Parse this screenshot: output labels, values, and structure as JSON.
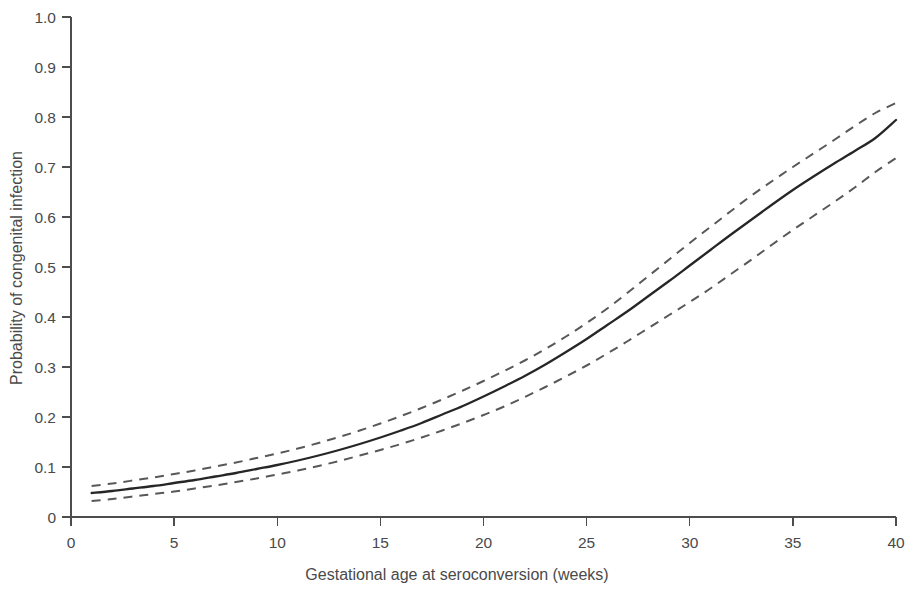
{
  "chart_data": {
    "type": "line",
    "title": "",
    "subtitle": "",
    "xlabel": "Gestational age at seroconversion (weeks)",
    "ylabel": "Probability of congenital infection",
    "xlim": [
      0,
      40
    ],
    "ylim": [
      0,
      1.0
    ],
    "grid": false,
    "legend": null,
    "legend_position": "none",
    "xticks": [
      0,
      5,
      10,
      15,
      20,
      25,
      30,
      35,
      40
    ],
    "xtick_labels": [
      "0",
      "5",
      "10",
      "15",
      "20",
      "25",
      "30",
      "35",
      "40"
    ],
    "yticks": [
      0,
      0.1,
      0.2,
      0.3,
      0.4,
      0.5,
      0.6,
      0.7,
      0.8,
      0.9,
      1.0
    ],
    "ytick_labels": [
      "0",
      "0.1",
      "0.2",
      "0.3",
      "0.4",
      "0.5",
      "0.6",
      "0.7",
      "0.8",
      "0.9",
      "1.0"
    ],
    "x": [
      1,
      2,
      3,
      4,
      5,
      6,
      7,
      8,
      9,
      10,
      11,
      12,
      13,
      14,
      15,
      16,
      17,
      18,
      19,
      20,
      21,
      22,
      23,
      24,
      25,
      26,
      27,
      28,
      29,
      30,
      31,
      32,
      33,
      34,
      35,
      36,
      37,
      38,
      39,
      40
    ],
    "series": [
      {
        "name": "Fitted probability of congenital infection",
        "style": "solid",
        "color": "#262626",
        "values": [
          0.048,
          0.052,
          0.057,
          0.062,
          0.068,
          0.074,
          0.081,
          0.088,
          0.096,
          0.104,
          0.113,
          0.123,
          0.134,
          0.146,
          0.159,
          0.173,
          0.188,
          0.205,
          0.222,
          0.241,
          0.261,
          0.282,
          0.305,
          0.33,
          0.356,
          0.384,
          0.412,
          0.442,
          0.472,
          0.503,
          0.534,
          0.565,
          0.595,
          0.625,
          0.654,
          0.681,
          0.707,
          0.732,
          0.758,
          0.794
        ]
      },
      {
        "name": "Upper 95% confidence limit",
        "style": "dashed",
        "color": "#585858",
        "values": [
          0.062,
          0.067,
          0.073,
          0.079,
          0.086,
          0.093,
          0.101,
          0.109,
          0.118,
          0.127,
          0.137,
          0.148,
          0.16,
          0.173,
          0.187,
          0.202,
          0.218,
          0.235,
          0.253,
          0.272,
          0.292,
          0.313,
          0.336,
          0.361,
          0.388,
          0.417,
          0.449,
          0.482,
          0.515,
          0.548,
          0.58,
          0.612,
          0.643,
          0.672,
          0.7,
          0.727,
          0.754,
          0.782,
          0.808,
          0.828
        ]
      },
      {
        "name": "Lower 95% confidence limit",
        "style": "dashed",
        "color": "#585858",
        "values": [
          0.032,
          0.036,
          0.041,
          0.046,
          0.051,
          0.057,
          0.063,
          0.07,
          0.077,
          0.085,
          0.093,
          0.102,
          0.112,
          0.123,
          0.134,
          0.146,
          0.159,
          0.173,
          0.188,
          0.204,
          0.221,
          0.24,
          0.26,
          0.281,
          0.303,
          0.327,
          0.352,
          0.378,
          0.404,
          0.43,
          0.457,
          0.486,
          0.515,
          0.545,
          0.574,
          0.602,
          0.63,
          0.659,
          0.69,
          0.718
        ]
      }
    ]
  },
  "axes": {
    "x_title": "Gestational age at seroconversion (weeks)",
    "y_title": "Probability of congenital infection"
  }
}
